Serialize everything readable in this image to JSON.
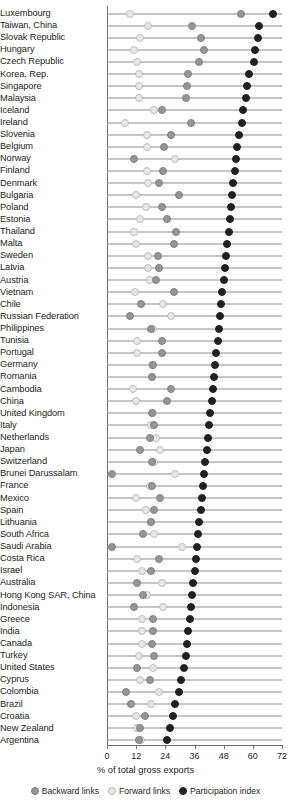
{
  "chart_data": {
    "type": "scatter",
    "title": "",
    "xlabel": "% of total gross exports",
    "ylabel": "",
    "xlim": [
      0,
      72
    ],
    "xticks": [
      0,
      12,
      24,
      36,
      48,
      60,
      72
    ],
    "grid": false,
    "orientation": "horizontal",
    "legend_position": "bottom",
    "colors": {
      "backward": "#939598",
      "forward": "#e6e7e8",
      "participation": "#231f20"
    },
    "legend": [
      {
        "key": "backward",
        "label": "Backward links"
      },
      {
        "key": "forward",
        "label": "Forward links"
      },
      {
        "key": "participation",
        "label": "Participation index"
      }
    ],
    "series": [
      {
        "name": "Backward links",
        "key": "backward"
      },
      {
        "name": "Forward links",
        "key": "forward"
      },
      {
        "name": "Participation index",
        "key": "participation"
      }
    ],
    "categories": [
      "Luxembourg",
      "Taiwan, China",
      "Slovak Republic",
      "Hungary",
      "Czech Republic",
      "Korea, Rep.",
      "Singapore",
      "Malaysia",
      "Iceland",
      "Ireland",
      "Slovenia",
      "Belgium",
      "Norway",
      "Finland",
      "Denmark",
      "Bulgaria",
      "Poland",
      "Estonia",
      "Thailand",
      "Malta",
      "Sweden",
      "Latvia",
      "Austria",
      "Vietnam",
      "Chile",
      "Russian Federation",
      "Philippines",
      "Tunisia",
      "Portugal",
      "Germany",
      "Romania",
      "Cambodia",
      "China",
      "United Kingdom",
      "Italy",
      "Netherlands",
      "Japan",
      "Switzerland",
      "Brunei Darussalam",
      "France",
      "Mexico",
      "Spain",
      "Lithuania",
      "South Africa",
      "Saudi Arabia",
      "Costa Rica",
      "Israel",
      "Australia",
      "Hong Kong SAR, China",
      "Indonesia",
      "Greece",
      "India",
      "Canada",
      "Turkey",
      "United States",
      "Cyprus",
      "Colombia",
      "Brazil",
      "Croatia",
      "New Zealand",
      "Argentina"
    ],
    "rows": [
      {
        "country": "Luxembourg",
        "backward": 55.0,
        "forward": 9.5,
        "participation": 68.5
      },
      {
        "country": "Taiwan, China",
        "backward": 35.0,
        "forward": 17.0,
        "participation": 62.5
      },
      {
        "country": "Slovak Republic",
        "backward": 38.5,
        "forward": 13.5,
        "participation": 62.0
      },
      {
        "country": "Hungary",
        "backward": 40.0,
        "forward": 11.0,
        "participation": 61.0
      },
      {
        "country": "Czech Republic",
        "backward": 38.0,
        "forward": 12.5,
        "participation": 60.5
      },
      {
        "country": "Korea, Rep.",
        "backward": 33.5,
        "forward": 13.0,
        "participation": 58.5
      },
      {
        "country": "Singapore",
        "backward": 33.0,
        "forward": 13.0,
        "participation": 57.5
      },
      {
        "country": "Malaysia",
        "backward": 32.5,
        "forward": 13.0,
        "participation": 57.0
      },
      {
        "country": "Iceland",
        "backward": 22.5,
        "forward": 19.5,
        "participation": 56.0
      },
      {
        "country": "Ireland",
        "backward": 34.5,
        "forward": 7.5,
        "participation": 55.5
      },
      {
        "country": "Slovenia",
        "backward": 26.5,
        "forward": 16.5,
        "participation": 54.5
      },
      {
        "country": "Belgium",
        "backward": 23.5,
        "forward": 16.5,
        "participation": 53.5
      },
      {
        "country": "Norway",
        "backward": 11.0,
        "forward": 28.0,
        "participation": 53.0
      },
      {
        "country": "Finland",
        "backward": 23.0,
        "forward": 16.5,
        "participation": 52.5
      },
      {
        "country": "Denmark",
        "backward": 21.5,
        "forward": 17.0,
        "participation": 52.0
      },
      {
        "country": "Bulgaria",
        "backward": 29.5,
        "forward": 12.0,
        "participation": 51.5
      },
      {
        "country": "Poland",
        "backward": 22.5,
        "forward": 16.0,
        "participation": 51.0
      },
      {
        "country": "Estonia",
        "backward": 24.5,
        "forward": 13.5,
        "participation": 50.5
      },
      {
        "country": "Thailand",
        "backward": 28.5,
        "forward": 11.0,
        "participation": 50.0
      },
      {
        "country": "Malta",
        "backward": 27.5,
        "forward": 12.0,
        "participation": 49.5
      },
      {
        "country": "Sweden",
        "backward": 21.0,
        "forward": 17.0,
        "participation": 49.0
      },
      {
        "country": "Latvia",
        "backward": 21.5,
        "forward": 17.0,
        "participation": 48.5
      },
      {
        "country": "Austria",
        "backward": 20.0,
        "forward": 17.5,
        "participation": 48.0
      },
      {
        "country": "Vietnam",
        "backward": 27.5,
        "forward": 11.5,
        "participation": 47.5
      },
      {
        "country": "Chile",
        "backward": 14.0,
        "forward": 23.0,
        "participation": 47.0
      },
      {
        "country": "Russian Federation",
        "backward": 9.5,
        "forward": 26.5,
        "participation": 46.5
      },
      {
        "country": "Philippines",
        "backward": 18.0,
        "forward": 19.0,
        "participation": 46.0
      },
      {
        "country": "Tunisia",
        "backward": 22.5,
        "forward": 12.5,
        "participation": 45.5
      },
      {
        "country": "Portugal",
        "backward": 22.5,
        "forward": 12.5,
        "participation": 45.0
      },
      {
        "country": "Germany",
        "backward": 19.0,
        "forward": 18.5,
        "participation": 44.5
      },
      {
        "country": "Romania",
        "backward": 18.5,
        "forward": 18.5,
        "participation": 44.0
      },
      {
        "country": "Cambodia",
        "backward": 26.5,
        "forward": 10.5,
        "participation": 43.5
      },
      {
        "country": "China",
        "backward": 24.5,
        "forward": 12.0,
        "participation": 43.0
      },
      {
        "country": "United Kingdom",
        "backward": 18.5,
        "forward": 19.0,
        "participation": 42.5
      },
      {
        "country": "Italy",
        "backward": 19.5,
        "forward": 18.0,
        "participation": 42.0
      },
      {
        "country": "Netherlands",
        "backward": 17.5,
        "forward": 20.0,
        "participation": 41.5
      },
      {
        "country": "Japan",
        "backward": 13.5,
        "forward": 22.0,
        "participation": 41.0
      },
      {
        "country": "Switzerland",
        "backward": 18.5,
        "forward": 19.5,
        "participation": 40.5
      },
      {
        "country": "Brunei Darussalam",
        "backward": 2.0,
        "forward": 28.0,
        "participation": 40.0
      },
      {
        "country": "France",
        "backward": 18.5,
        "forward": 17.5,
        "participation": 39.5
      },
      {
        "country": "Mexico",
        "backward": 22.0,
        "forward": 12.0,
        "participation": 39.0
      },
      {
        "country": "Spain",
        "backward": 19.5,
        "forward": 16.0,
        "participation": 38.5
      },
      {
        "country": "Lithuania",
        "backward": 18.0,
        "forward": 18.0,
        "participation": 38.0
      },
      {
        "country": "South Africa",
        "backward": 15.0,
        "forward": 19.5,
        "participation": 37.5
      },
      {
        "country": "Saudi Arabia",
        "backward": 2.0,
        "forward": 31.0,
        "participation": 37.0
      },
      {
        "country": "Costa Rica",
        "backward": 21.5,
        "forward": 12.5,
        "participation": 36.5
      },
      {
        "country": "Israel",
        "backward": 18.0,
        "forward": 14.5,
        "participation": 36.0
      },
      {
        "country": "Australia",
        "backward": 12.5,
        "forward": 22.5,
        "participation": 35.5
      },
      {
        "country": "Hong Kong SAR, China",
        "backward": 15.0,
        "forward": 16.5,
        "participation": 35.0
      },
      {
        "country": "Indonesia",
        "backward": 11.0,
        "forward": 23.0,
        "participation": 34.5
      },
      {
        "country": "Greece",
        "backward": 19.0,
        "forward": 14.5,
        "participation": 34.0
      },
      {
        "country": "India",
        "backward": 19.0,
        "forward": 14.5,
        "participation": 33.5
      },
      {
        "country": "Canada",
        "backward": 18.5,
        "forward": 14.5,
        "participation": 33.0
      },
      {
        "country": "Turkey",
        "backward": 19.5,
        "forward": 13.0,
        "participation": 32.5
      },
      {
        "country": "United States",
        "backward": 12.5,
        "forward": 19.0,
        "participation": 31.5
      },
      {
        "country": "Cyprus",
        "backward": 17.5,
        "forward": 13.5,
        "participation": 30.5
      },
      {
        "country": "Colombia",
        "backward": 8.0,
        "forward": 21.5,
        "participation": 29.5
      },
      {
        "country": "Brazil",
        "backward": 10.0,
        "forward": 18.0,
        "participation": 28.0
      },
      {
        "country": "Croatia",
        "backward": 15.5,
        "forward": 12.0,
        "participation": 27.0
      },
      {
        "country": "New Zealand",
        "backward": 13.5,
        "forward": 12.5,
        "participation": 26.0
      },
      {
        "country": "Argentina",
        "backward": 13.0,
        "forward": 14.0,
        "participation": 24.5
      }
    ]
  }
}
